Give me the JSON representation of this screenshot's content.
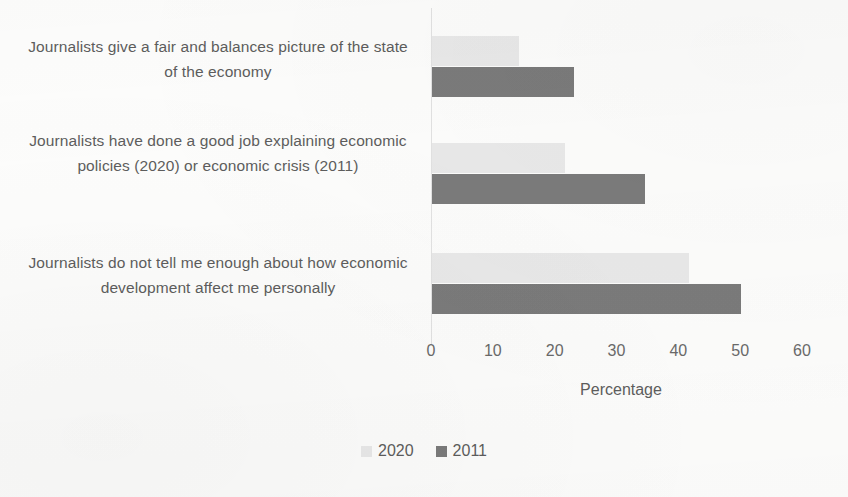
{
  "chart_data": {
    "type": "bar",
    "orientation": "horizontal",
    "title": "",
    "xlabel": "Percentage",
    "ylabel": "",
    "xlim": [
      0,
      60
    ],
    "xticks": [
      0,
      10,
      20,
      30,
      40,
      50,
      60
    ],
    "xtick_labels": [
      "0",
      "10",
      "20",
      "30",
      "40",
      "50",
      "60"
    ],
    "grid": false,
    "legend_position": "bottom",
    "categories": [
      "Journalists give a fair and balances picture of the state of the economy",
      "Journalists have done a good job explaining economic policies (2020) or economic crisis (2011)",
      "Journalists do not tell me enough about how economic development affect me personally"
    ],
    "series": [
      {
        "name": "2020",
        "color": "#e9e9e9",
        "values": [
          14,
          21.5,
          41.5
        ]
      },
      {
        "name": "2011",
        "color": "#7b7b7b",
        "values": [
          23,
          34.5,
          50
        ]
      }
    ]
  },
  "legend": {
    "entries": [
      {
        "label": "2020",
        "color": "#e9e9e9"
      },
      {
        "label": "2011",
        "color": "#7b7b7b"
      }
    ]
  }
}
